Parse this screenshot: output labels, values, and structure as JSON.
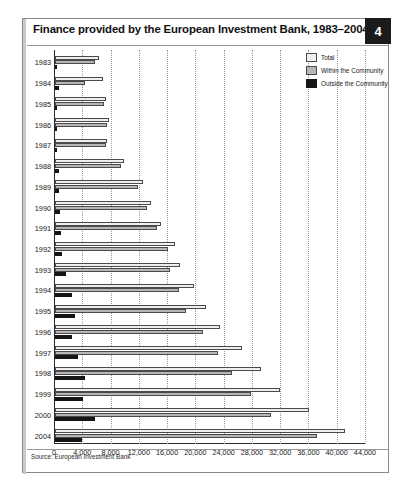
{
  "figure": {
    "title": "Finance provided by the European Investment Bank, 1983–2004",
    "badge": "4",
    "source": "Source: European Investment Bank"
  },
  "legend": {
    "position": "top-right",
    "items": [
      {
        "label": "Total",
        "color": "#efefef"
      },
      {
        "label": "Within the Community",
        "color": "#b6b6b6"
      },
      {
        "label": "Outside the Community",
        "color": "#161616"
      }
    ]
  },
  "chart_data": {
    "type": "bar",
    "orientation": "horizontal",
    "title": "Finance provided by the European Investment Bank, 1983–2004",
    "xlabel": "",
    "ylabel": "",
    "xlim": [
      0,
      44000
    ],
    "xticks": [
      "0",
      "4,000",
      "8,000",
      "12,000",
      "16,000",
      "20,000",
      "24,000",
      "28,000",
      "32,000",
      "36,000",
      "40,000",
      "44,000"
    ],
    "xtick_values": [
      0,
      4000,
      8000,
      12000,
      16000,
      20000,
      24000,
      28000,
      32000,
      36000,
      40000,
      44000
    ],
    "grid": "vertical-dotted",
    "categories": [
      "1983",
      "1984",
      "1985",
      "1986",
      "1987",
      "1988",
      "1989",
      "1990",
      "1991",
      "1992",
      "1993",
      "1994",
      "1995",
      "1996",
      "1997",
      "1998",
      "1999",
      "2000",
      "2004"
    ],
    "series": [
      {
        "name": "Total",
        "color": "#efefef",
        "values": [
          6200,
          6800,
          7200,
          7700,
          7400,
          9700,
          12500,
          13600,
          15000,
          17000,
          17700,
          19700,
          21400,
          23300,
          26500,
          29200,
          31800,
          36000,
          41000
        ]
      },
      {
        "name": "Within the Community",
        "color": "#b6b6b6",
        "values": [
          5600,
          4300,
          7000,
          7300,
          7200,
          9400,
          11800,
          13000,
          14500,
          16000,
          16200,
          17500,
          18600,
          21000,
          23000,
          25000,
          27800,
          30500,
          37000
        ]
      },
      {
        "name": "Outside the Community",
        "color": "#161616",
        "values": [
          300,
          500,
          300,
          300,
          300,
          500,
          500,
          700,
          800,
          1000,
          1500,
          2400,
          2800,
          2400,
          3300,
          4300,
          4000,
          5700,
          3800
        ]
      }
    ]
  }
}
